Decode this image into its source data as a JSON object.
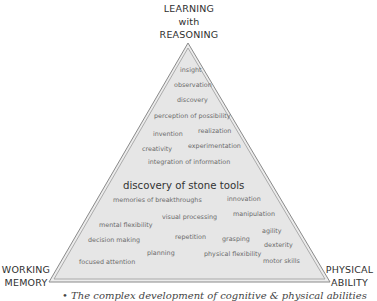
{
  "corners": {
    "apex": [
      "LEARNING",
      "with",
      "REASONING"
    ],
    "left": [
      "WORKING",
      "MEMORY"
    ],
    "right": [
      "PHYSICAL",
      "ABILITY"
    ]
  },
  "center_label": "discovery of stone tools",
  "terms": [
    {
      "text": "insight",
      "x": 180,
      "y": 71
    },
    {
      "text": "observation",
      "x": 174,
      "y": 86
    },
    {
      "text": "discovery",
      "x": 177,
      "y": 101
    },
    {
      "text": "perception of possibility",
      "x": 154,
      "y": 117
    },
    {
      "text": "invention",
      "x": 153,
      "y": 135
    },
    {
      "text": "realization",
      "x": 198,
      "y": 132
    },
    {
      "text": "creativity",
      "x": 142,
      "y": 150
    },
    {
      "text": "experimentation",
      "x": 188,
      "y": 147
    },
    {
      "text": "integration of information",
      "x": 148,
      "y": 163
    },
    {
      "text": "memories of breakthroughs",
      "x": 113,
      "y": 201
    },
    {
      "text": "innovation",
      "x": 227,
      "y": 200
    },
    {
      "text": "visual processing",
      "x": 162,
      "y": 218
    },
    {
      "text": "manipulation",
      "x": 233,
      "y": 215
    },
    {
      "text": "mental flexibility",
      "x": 99,
      "y": 226
    },
    {
      "text": "agility",
      "x": 262,
      "y": 232
    },
    {
      "text": "repetition",
      "x": 175,
      "y": 238
    },
    {
      "text": "grasping",
      "x": 222,
      "y": 240
    },
    {
      "text": "decision making",
      "x": 88,
      "y": 241
    },
    {
      "text": "dexterity",
      "x": 264,
      "y": 246
    },
    {
      "text": "planning",
      "x": 147,
      "y": 254
    },
    {
      "text": "physical flexibility",
      "x": 204,
      "y": 255
    },
    {
      "text": "focused attention",
      "x": 79,
      "y": 263
    },
    {
      "text": "motor skills",
      "x": 263,
      "y": 262
    }
  ],
  "caption": "• The complex development of cognitive & physical abilities"
}
